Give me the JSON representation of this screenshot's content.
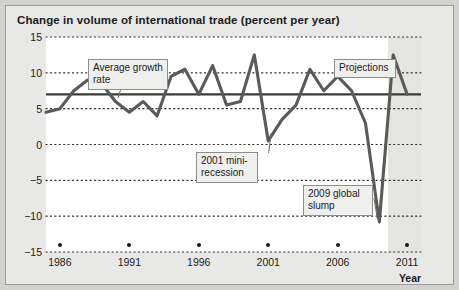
{
  "figure": {
    "title": "Change in volume of international trade (percent per year)",
    "axis_title": "Year",
    "frame_color": "#9a9a98",
    "background": "#e8e8e6",
    "plot_background": "#ffffff",
    "projection_band_color": "#e4e4e2"
  },
  "annotations": {
    "average_growth": "Average growth\nrate",
    "mini_recession": "2001 mini-\nrecession",
    "global_slump": "2009 global\nslump",
    "projections": "Projections"
  },
  "chart_data": {
    "type": "line",
    "title": "Change in volume of international trade (percent per year)",
    "xlabel": "Year",
    "ylabel": "",
    "xlim": [
      1985,
      2012
    ],
    "ylim": [
      -15,
      15
    ],
    "yticks": [
      15,
      10,
      5,
      0,
      -5,
      -10,
      -15
    ],
    "xticks": [
      1986,
      1991,
      1996,
      2001,
      2006,
      2011
    ],
    "grid": "horizontal-dotted",
    "legend": "none",
    "line_color": "#5a5a58",
    "reference_line": {
      "label": "Average growth rate",
      "value": 7.0,
      "color": "#3a3a38"
    },
    "projection_start_year": 2010,
    "series": [
      {
        "name": "Change in volume of international trade",
        "x": [
          1985,
          1986,
          1987,
          1988,
          1989,
          1990,
          1991,
          1992,
          1993,
          1994,
          1995,
          1996,
          1997,
          1998,
          1999,
          2000,
          2001,
          2002,
          2003,
          2004,
          2005,
          2006,
          2007,
          2008,
          2009,
          2010,
          2011
        ],
        "values": [
          4.5,
          5.0,
          7.5,
          9.0,
          8.5,
          6.0,
          4.5,
          6.0,
          4.0,
          9.5,
          10.5,
          7.0,
          11.0,
          5.5,
          6.0,
          12.5,
          0.5,
          3.5,
          5.5,
          10.5,
          7.5,
          9.5,
          7.5,
          3.0,
          -10.8,
          12.5,
          7.0
        ]
      }
    ],
    "events": [
      {
        "year": 2001,
        "label": "2001 mini-recession",
        "value": 0.5
      },
      {
        "year": 2009,
        "label": "2009 global slump",
        "value": -10.8
      },
      {
        "year": 2010,
        "label": "Projections",
        "value": 12.5
      }
    ]
  }
}
